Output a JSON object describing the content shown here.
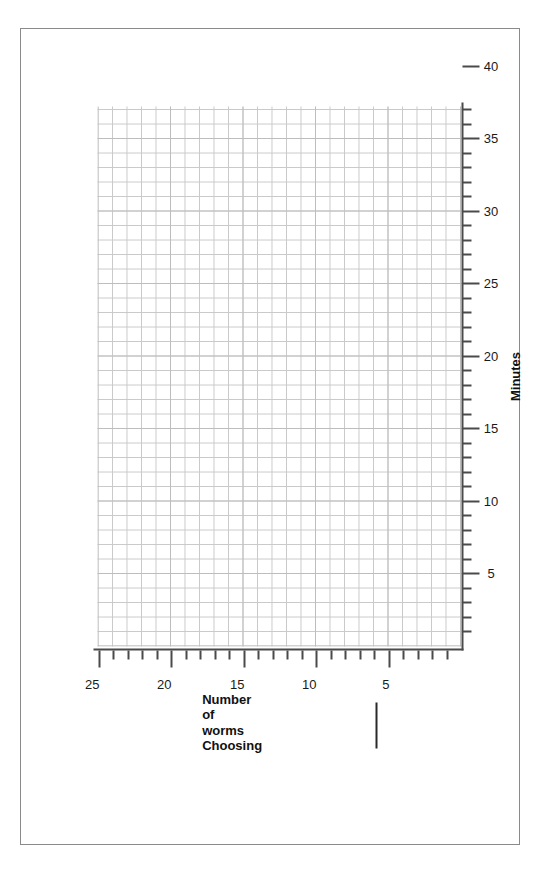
{
  "page": {
    "background_color": "#ffffff",
    "frame_color": "#8a8a8a",
    "orientation": "rotated-90-ccw"
  },
  "chart_data": {
    "type": "line",
    "title": "",
    "subtitle": "",
    "xlabel": "Minutes",
    "ylabel": "Number of worms Choosing",
    "ylabel_lines": [
      "Number",
      "of",
      "worms",
      "Choosing"
    ],
    "xlim": [
      0,
      43
    ],
    "ylim": [
      0,
      26
    ],
    "xticks_major": [
      5,
      10,
      15,
      20,
      25,
      30,
      35,
      40
    ],
    "xticks_major_labels": [
      "5",
      "10",
      "15",
      "20",
      "25",
      "30",
      "35",
      "40"
    ],
    "xticks_minor": [
      1,
      2,
      3,
      4,
      6,
      7,
      8,
      9,
      11,
      12,
      13,
      14,
      16,
      17,
      18,
      19,
      21,
      22,
      23,
      24,
      26,
      27,
      28,
      29,
      31,
      32,
      33,
      34,
      36,
      37,
      38,
      39,
      41,
      42,
      43
    ],
    "yticks_major": [
      5,
      10,
      15,
      20,
      25
    ],
    "yticks_major_labels": [
      "5",
      "10",
      "15",
      "20",
      "25"
    ],
    "yticks_minor": [
      1,
      2,
      3,
      4,
      6,
      7,
      8,
      9,
      11,
      12,
      13,
      14,
      16,
      17,
      18,
      19,
      21,
      22,
      23,
      24,
      26
    ],
    "series": [
      {
        "name": "",
        "x": [],
        "values": []
      }
    ],
    "grid": true,
    "grid_minor_spacing": 1,
    "grid_major_spacing": 5,
    "grid_color": "#c9c9c9",
    "axis_color": "#4a4a4a",
    "legend": {
      "position": "below-axis-left",
      "entries": [
        {
          "label": "",
          "marker": "solid-line",
          "color": "#2a2a2a"
        }
      ]
    },
    "annotations": [],
    "note": "Blank graph-paper template; no data plotted."
  }
}
